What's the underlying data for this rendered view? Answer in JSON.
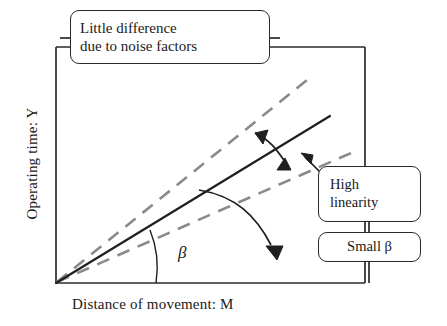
{
  "figure": {
    "type": "diagram",
    "subtype": "ideal-function-schematic",
    "axes": {
      "y_label": "Operating time: Y",
      "x_label": "Distance of movement: M",
      "origin_label": "",
      "frame": "left-and-top-and-right"
    },
    "angle_marker": {
      "symbol": "β",
      "description": "angle between solid ideal line and the M axis"
    },
    "lines": [
      {
        "name": "ideal-relation-solid",
        "style": "solid",
        "color": "#1f1f1f",
        "role": "ideal linear relation"
      },
      {
        "name": "noise-upper-dashed",
        "style": "dashed",
        "color": "#8a8a8a",
        "role": "upper noise-shifted response"
      },
      {
        "name": "noise-lower-dashed",
        "style": "dashed",
        "color": "#8a8a8a",
        "role": "lower noise-shifted response"
      }
    ],
    "callouts": [
      {
        "id": "noise",
        "lines": [
          "Little difference",
          "due to noise factors"
        ],
        "points_to": "spread between the two dashed lines"
      },
      {
        "id": "linearity",
        "lines": [
          "High",
          "linearity"
        ],
        "points_to": "lower dashed response line"
      },
      {
        "id": "small-beta",
        "lines": [
          "Small β"
        ],
        "points_to": "angle beta at the origin"
      }
    ],
    "arrows": [
      {
        "name": "noise-spread-double-arrow",
        "heads": "both",
        "shape": "curved"
      },
      {
        "name": "beta-pointer-arrow",
        "heads": "single",
        "shape": "curved"
      },
      {
        "name": "linearity-pointer-arrow",
        "heads": "single",
        "shape": "straight"
      }
    ]
  },
  "colors": {
    "ink": "#1a1a1a",
    "solid_line": "#1f1f1f",
    "dashed_line": "#8a8a8a",
    "frame": "#2a2a2a",
    "background": "#ffffff"
  }
}
